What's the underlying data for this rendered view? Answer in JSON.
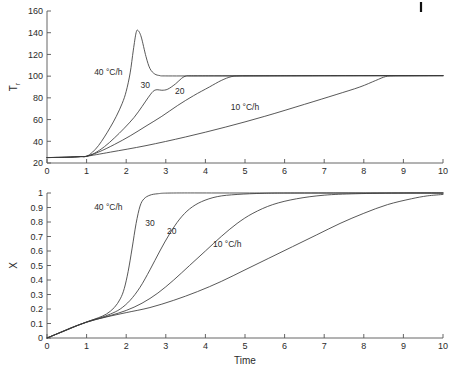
{
  "figure": {
    "corner_mark": "top-right-tick-artifact"
  },
  "chart_data": [
    {
      "type": "line",
      "id": "temperature-chart",
      "title": "",
      "xlabel": "",
      "ylabel": "T r",
      "ylabel_main": "T",
      "ylabel_sub": "r",
      "xlim": [
        0,
        10
      ],
      "ylim": [
        20,
        160
      ],
      "grid": false,
      "legend": "inline-annotations",
      "xticks": [
        0,
        1,
        2,
        3,
        4,
        5,
        6,
        7,
        8,
        9,
        10
      ],
      "xticklabels": [
        "0",
        "1",
        "2",
        "3",
        "4",
        "5",
        "6",
        "7",
        "8",
        "9",
        "10"
      ],
      "yticks": [
        20,
        40,
        60,
        80,
        100,
        120,
        140,
        160
      ],
      "yticklabels": [
        "20",
        "40",
        "60",
        "80",
        "100",
        "120",
        "140",
        "160"
      ],
      "annotations": [
        {
          "text": "40 °C/h",
          "x": 1.55,
          "y": 101
        },
        {
          "text": "30",
          "x": 2.48,
          "y": 89
        },
        {
          "text": "20",
          "x": 3.35,
          "y": 84
        },
        {
          "text": "10 °C/h",
          "x": 5.0,
          "y": 69
        }
      ],
      "series": [
        {
          "name": "40 °C/h",
          "points": [
            [
              0,
              25
            ],
            [
              0.3,
              25.2
            ],
            [
              0.6,
              25.5
            ],
            [
              0.85,
              25.9
            ],
            [
              1.0,
              26.2
            ],
            [
              1.15,
              30
            ],
            [
              1.3,
              36
            ],
            [
              1.45,
              44
            ],
            [
              1.6,
              53
            ],
            [
              1.75,
              63
            ],
            [
              1.9,
              75
            ],
            [
              2.0,
              86
            ],
            [
              2.1,
              103
            ],
            [
              2.18,
              124
            ],
            [
              2.25,
              140
            ],
            [
              2.3,
              142
            ],
            [
              2.38,
              136
            ],
            [
              2.5,
              118
            ],
            [
              2.6,
              107
            ],
            [
              2.72,
              102
            ],
            [
              2.85,
              100.5
            ],
            [
              3.0,
              100.2
            ],
            [
              4.0,
              100.2
            ],
            [
              6.0,
              100.3
            ],
            [
              8.0,
              100.4
            ],
            [
              10,
              100.5
            ]
          ]
        },
        {
          "name": "30",
          "points": [
            [
              0,
              25
            ],
            [
              0.5,
              25.3
            ],
            [
              0.85,
              25.9
            ],
            [
              1.0,
              26.2
            ],
            [
              1.2,
              29
            ],
            [
              1.45,
              35
            ],
            [
              1.7,
              43
            ],
            [
              1.95,
              52
            ],
            [
              2.2,
              62
            ],
            [
              2.4,
              72
            ],
            [
              2.55,
              80
            ],
            [
              2.68,
              86
            ],
            [
              2.78,
              87.5
            ],
            [
              2.9,
              87
            ],
            [
              3.05,
              88
            ],
            [
              3.25,
              93
            ],
            [
              3.4,
              98
            ],
            [
              3.52,
              100.2
            ],
            [
              3.7,
              100.3
            ],
            [
              5.0,
              100.3
            ],
            [
              7.0,
              100.4
            ],
            [
              10,
              100.5
            ]
          ]
        },
        {
          "name": "20",
          "points": [
            [
              0,
              25
            ],
            [
              0.5,
              25.3
            ],
            [
              0.85,
              25.9
            ],
            [
              1.0,
              26.2
            ],
            [
              1.3,
              30
            ],
            [
              1.7,
              37
            ],
            [
              2.1,
              45
            ],
            [
              2.5,
              54
            ],
            [
              2.9,
              63
            ],
            [
              3.3,
              73
            ],
            [
              3.7,
              82
            ],
            [
              4.1,
              90
            ],
            [
              4.4,
              96
            ],
            [
              4.65,
              99.5
            ],
            [
              4.85,
              100.2
            ],
            [
              5.2,
              100.3
            ],
            [
              7.0,
              100.4
            ],
            [
              10,
              100.5
            ]
          ]
        },
        {
          "name": "10 °C/h",
          "points": [
            [
              0,
              25
            ],
            [
              0.5,
              25.3
            ],
            [
              0.85,
              25.9
            ],
            [
              1.0,
              26.2
            ],
            [
              1.6,
              30
            ],
            [
              2.5,
              36
            ],
            [
              3.5,
              44
            ],
            [
              4.5,
              53
            ],
            [
              5.5,
              63
            ],
            [
              6.5,
              74
            ],
            [
              7.3,
              83
            ],
            [
              7.9,
              90
            ],
            [
              8.3,
              96
            ],
            [
              8.55,
              99.6
            ],
            [
              8.75,
              100.2
            ],
            [
              9.2,
              100.3
            ],
            [
              10,
              100.4
            ]
          ]
        }
      ]
    },
    {
      "type": "line",
      "id": "conversion-chart",
      "title": "",
      "xlabel": "Time",
      "ylabel": "X",
      "xlim": [
        0,
        10
      ],
      "ylim": [
        0,
        1
      ],
      "grid": false,
      "legend": "inline-annotations",
      "xticks": [
        0,
        1,
        2,
        3,
        4,
        5,
        6,
        7,
        8,
        9,
        10
      ],
      "xticklabels": [
        "0",
        "1",
        "2",
        "3",
        "4",
        "5",
        "6",
        "7",
        "8",
        "9",
        "10"
      ],
      "yticks": [
        0,
        0.1,
        0.2,
        0.3,
        0.4,
        0.5,
        0.6,
        0.7,
        0.8,
        0.9,
        1
      ],
      "yticklabels": [
        "0",
        "0.1",
        "0.2",
        "0.3",
        "0.4",
        "0.5",
        "0.6",
        "0.7",
        "0.8",
        "0.9",
        "1"
      ],
      "annotations": [
        {
          "text": "40 °C/h",
          "x": 1.55,
          "y": 0.88
        },
        {
          "text": "30",
          "x": 2.6,
          "y": 0.77
        },
        {
          "text": "20",
          "x": 3.15,
          "y": 0.72
        },
        {
          "text": "10 °C/h",
          "x": 4.55,
          "y": 0.63
        }
      ],
      "series": [
        {
          "name": "40 °C/h",
          "points": [
            [
              0,
              0
            ],
            [
              0.3,
              0.035
            ],
            [
              0.6,
              0.07
            ],
            [
              0.9,
              0.1
            ],
            [
              1.1,
              0.12
            ],
            [
              1.3,
              0.14
            ],
            [
              1.5,
              0.165
            ],
            [
              1.7,
              0.21
            ],
            [
              1.85,
              0.27
            ],
            [
              1.95,
              0.34
            ],
            [
              2.05,
              0.46
            ],
            [
              2.15,
              0.62
            ],
            [
              2.25,
              0.79
            ],
            [
              2.35,
              0.91
            ],
            [
              2.45,
              0.96
            ],
            [
              2.6,
              0.985
            ],
            [
              2.8,
              0.995
            ],
            [
              3.2,
              1.0
            ],
            [
              5,
              1.0
            ],
            [
              10,
              1.0
            ]
          ]
        },
        {
          "name": "30",
          "points": [
            [
              0,
              0
            ],
            [
              0.4,
              0.045
            ],
            [
              0.8,
              0.09
            ],
            [
              1.1,
              0.12
            ],
            [
              1.35,
              0.14
            ],
            [
              1.6,
              0.165
            ],
            [
              1.85,
              0.2
            ],
            [
              2.1,
              0.26
            ],
            [
              2.35,
              0.35
            ],
            [
              2.6,
              0.47
            ],
            [
              2.85,
              0.6
            ],
            [
              3.1,
              0.72
            ],
            [
              3.35,
              0.82
            ],
            [
              3.6,
              0.89
            ],
            [
              3.9,
              0.94
            ],
            [
              4.3,
              0.975
            ],
            [
              4.8,
              0.99
            ],
            [
              5.5,
              0.998
            ],
            [
              6.5,
              1.0
            ],
            [
              10,
              1.0
            ]
          ]
        },
        {
          "name": "20",
          "points": [
            [
              0,
              0
            ],
            [
              0.4,
              0.045
            ],
            [
              0.8,
              0.09
            ],
            [
              1.2,
              0.125
            ],
            [
              1.6,
              0.155
            ],
            [
              2.0,
              0.19
            ],
            [
              2.4,
              0.24
            ],
            [
              2.8,
              0.31
            ],
            [
              3.2,
              0.4
            ],
            [
              3.6,
              0.5
            ],
            [
              4.0,
              0.6
            ],
            [
              4.4,
              0.7
            ],
            [
              4.8,
              0.79
            ],
            [
              5.2,
              0.86
            ],
            [
              5.7,
              0.92
            ],
            [
              6.3,
              0.96
            ],
            [
              7.0,
              0.985
            ],
            [
              7.8,
              0.995
            ],
            [
              9,
              1.0
            ],
            [
              10,
              1.0
            ]
          ]
        },
        {
          "name": "10 °C/h",
          "points": [
            [
              0,
              0
            ],
            [
              0.5,
              0.055
            ],
            [
              1.0,
              0.11
            ],
            [
              1.5,
              0.145
            ],
            [
              2.0,
              0.175
            ],
            [
              2.6,
              0.21
            ],
            [
              3.2,
              0.26
            ],
            [
              3.8,
              0.32
            ],
            [
              4.4,
              0.39
            ],
            [
              5.0,
              0.47
            ],
            [
              5.6,
              0.55
            ],
            [
              6.2,
              0.63
            ],
            [
              6.8,
              0.71
            ],
            [
              7.4,
              0.79
            ],
            [
              8.0,
              0.86
            ],
            [
              8.6,
              0.92
            ],
            [
              9.2,
              0.96
            ],
            [
              9.6,
              0.98
            ],
            [
              10,
              0.99
            ]
          ]
        }
      ]
    }
  ]
}
